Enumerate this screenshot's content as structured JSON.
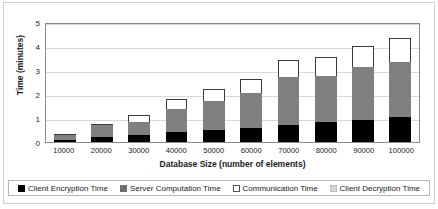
{
  "chart_data": {
    "type": "bar",
    "subtype": "stacked-bar",
    "title": "",
    "xlabel": "Database Size (number of elements)",
    "ylabel": "Time (minutes)",
    "categories": [
      "10000",
      "20000",
      "30000",
      "40000",
      "50000",
      "60000",
      "70000",
      "80000",
      "90000",
      "100000"
    ],
    "ylim": [
      0,
      5
    ],
    "yticks": [
      "0",
      "1",
      "2",
      "3",
      "4",
      "5"
    ],
    "grid": true,
    "legend_position": "bottom",
    "series": [
      {
        "name": "Client Encryption Time",
        "color": "#000000",
        "values": [
          0.1,
          0.2,
          0.28,
          0.42,
          0.5,
          0.58,
          0.7,
          0.82,
          0.92,
          1.05
        ]
      },
      {
        "name": "Server Computation Time",
        "color": "#808080",
        "values": [
          0.18,
          0.5,
          0.57,
          0.97,
          1.2,
          1.47,
          2.02,
          1.95,
          2.2,
          2.3
        ]
      },
      {
        "name": "Communication Time",
        "color": "#ffffff",
        "values": [
          0.07,
          0.05,
          0.27,
          0.4,
          0.52,
          0.58,
          0.68,
          0.78,
          0.88,
          1.0
        ]
      },
      {
        "name": "Client Decryption Time",
        "color": "#d4d4d4",
        "values": [
          0,
          0,
          0,
          0,
          0,
          0,
          0,
          0,
          0,
          0
        ]
      }
    ],
    "totals": [
      0.35,
      0.75,
      1.12,
      1.79,
      2.22,
      2.63,
      3.4,
      3.55,
      4.0,
      4.35
    ]
  },
  "legend": {
    "items": [
      {
        "label": "Client Encryption Time"
      },
      {
        "label": "Server Computation Time"
      },
      {
        "label": "Communication Time"
      },
      {
        "label": "Client Decryption Time"
      }
    ]
  }
}
